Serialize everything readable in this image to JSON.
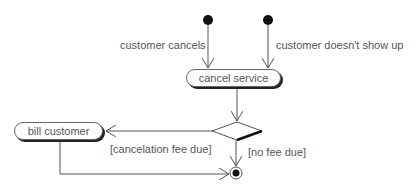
{
  "diagram": {
    "type": "uml-activity",
    "initial_nodes": [
      {
        "id": "start-cancel",
        "x": 208,
        "y": 20
      },
      {
        "id": "start-noshow",
        "x": 268,
        "y": 20
      }
    ],
    "activities": [
      {
        "id": "cancel-service",
        "label": "cancel service"
      },
      {
        "id": "bill-customer",
        "label": "bill customer"
      }
    ],
    "decision": {
      "id": "fee-decision"
    },
    "final_node": {
      "id": "end"
    },
    "edge_labels": {
      "customer_cancels": "customer cancels",
      "customer_no_show": "customer doesn't show up",
      "cancelation_fee_due": "[cancelation fee due]",
      "no_fee_due": "[no fee due]"
    },
    "colors": {
      "line": "#555555",
      "text": "#555555",
      "node": "#111111"
    }
  }
}
